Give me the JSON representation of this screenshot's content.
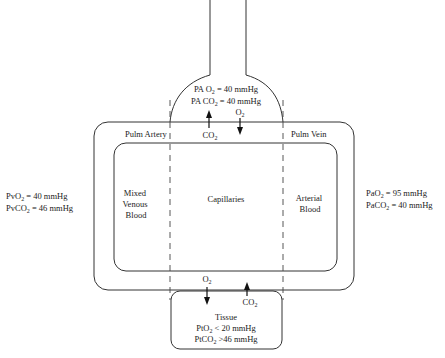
{
  "alveolus": {
    "po2_label": "PA O",
    "po2_sub": "2",
    "po2_value": " = 40 mmHg",
    "pco2_label": "PA CO",
    "pco2_sub": "2",
    "pco2_value": " = 40 mmHg"
  },
  "vessels": {
    "pulm_artery": "Pulm Artery",
    "pulm_vein": "Pulm Vein"
  },
  "gas_exchange_lung": {
    "co2_label": "CO",
    "co2_sub": "2",
    "o2_label": "O",
    "o2_sub": "2"
  },
  "compartments": {
    "mixed_venous": [
      "Mixed",
      "Venous",
      "Blood"
    ],
    "capillaries": "Capillaries",
    "arterial": [
      "Arterial",
      "Blood"
    ]
  },
  "venous_values": {
    "po2_label": "PvO",
    "po2_sub": "2",
    "po2_value": " = 40 mmHg",
    "pco2_label": "PvCO",
    "pco2_sub": "2",
    "pco2_value": " = 46 mmHg"
  },
  "arterial_values": {
    "po2_label": "PaO",
    "po2_sub": "2",
    "po2_value": " = 95 mmHg",
    "pco2_label": "PaCO",
    "pco2_sub": "2",
    "pco2_value": " = 40 mmHg"
  },
  "gas_exchange_tissue": {
    "o2_label": "O",
    "o2_sub": "2",
    "co2_label": "CO",
    "co2_sub": "2"
  },
  "tissue": {
    "title": "Tissue",
    "po2_label": "PtO",
    "po2_sub": "2",
    "po2_value": " < 20 mmHg",
    "pco2_label": "PtCO",
    "pco2_sub": "2",
    "pco2_value": " >46 mmHg"
  },
  "colors": {
    "line": "#333333",
    "text": "#222222",
    "background": "#ffffff"
  }
}
